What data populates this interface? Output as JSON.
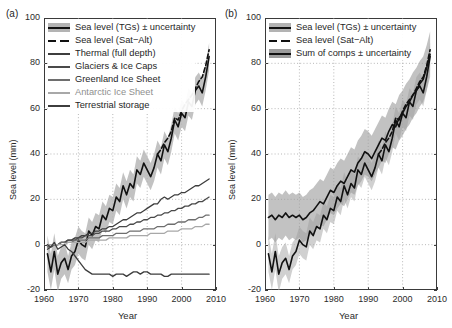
{
  "figure": {
    "panels": [
      {
        "tag": "(a)",
        "xlabel": "Year",
        "ylabel": "Sea level (mm)",
        "legend": [
          {
            "label": "Sea level (TGs) ± uncertainty",
            "style": "band-line",
            "color": "#111111",
            "band_color": "#b3b3b3"
          },
          {
            "label": "Sea level (Sat−Alt)",
            "style": "dashed",
            "color": "#111111"
          },
          {
            "label": "Thermal (full depth)",
            "style": "line",
            "color": "#3d3d3d"
          },
          {
            "label": "Glaciers & Ice Caps",
            "style": "line",
            "color": "#4a4a4a"
          },
          {
            "label": "Greenland Ice Sheet",
            "style": "line",
            "color": "#6e6e6e"
          },
          {
            "label": "Antarctic Ice Sheet",
            "style": "line",
            "color": "#a8a8a8"
          },
          {
            "label": "Terrestrial storage",
            "style": "line",
            "color": "#3d3d3d"
          }
        ]
      },
      {
        "tag": "(b)",
        "xlabel": "Year",
        "ylabel": "Sea level (mm)",
        "legend": [
          {
            "label": "Sea level (TGs) ± uncertainty",
            "style": "band-line",
            "color": "#111111",
            "band_color": "#b3b3b3"
          },
          {
            "label": "Sea level (Sat−Alt)",
            "style": "dashed",
            "color": "#111111"
          },
          {
            "label": "Sum of comps ± uncertainty",
            "style": "band-line",
            "color": "#111111",
            "band_color": "#9c9c9c"
          }
        ]
      }
    ]
  },
  "chart_data": [
    {
      "type": "line",
      "title": "",
      "panel": "(a)",
      "xlabel": "Year",
      "ylabel": "Sea level (mm)",
      "xlim": [
        1960,
        2010
      ],
      "ylim": [
        -20,
        100
      ],
      "xticks": [
        1960,
        1970,
        1980,
        1990,
        2000,
        2010
      ],
      "yticks": [
        -20,
        0,
        20,
        40,
        60,
        80,
        100
      ],
      "grid": true,
      "legend_position": "upper-left",
      "x": [
        1961,
        1962,
        1963,
        1964,
        1965,
        1966,
        1967,
        1968,
        1969,
        1970,
        1971,
        1972,
        1973,
        1974,
        1975,
        1976,
        1977,
        1978,
        1979,
        1980,
        1981,
        1982,
        1983,
        1984,
        1985,
        1986,
        1987,
        1988,
        1989,
        1990,
        1991,
        1992,
        1993,
        1994,
        1995,
        1996,
        1997,
        1998,
        1999,
        2000,
        2001,
        2002,
        2003,
        2004,
        2005,
        2006,
        2007,
        2008
      ],
      "series": [
        {
          "name": "Sea level (TGs) ± uncertainty",
          "style": "solid-with-band",
          "color": "#111111",
          "band_color": "#b3b3b3",
          "values": [
            -4,
            -12,
            -3,
            -13,
            -8,
            -6,
            -11,
            -5,
            -3,
            2,
            0,
            -1,
            6,
            4,
            8,
            7,
            13,
            11,
            16,
            15,
            21,
            19,
            26,
            22,
            27,
            25,
            33,
            31,
            36,
            33,
            30,
            34,
            40,
            37,
            44,
            41,
            47,
            55,
            52,
            58,
            56,
            63,
            61,
            68,
            70,
            67,
            74,
            83
          ],
          "band_lower": [
            -12,
            -20,
            -11,
            -21,
            -15,
            -13,
            -17,
            -11,
            -9,
            -4,
            -6,
            -7,
            0,
            -2,
            2,
            1,
            7,
            5,
            10,
            9,
            15,
            13,
            20,
            16,
            21,
            19,
            27,
            25,
            30,
            27,
            24,
            28,
            34,
            31,
            38,
            35,
            41,
            49,
            46,
            52,
            50,
            57,
            55,
            62,
            64,
            61,
            68,
            77
          ],
          "band_upper": [
            4,
            -4,
            5,
            -5,
            -1,
            1,
            -5,
            1,
            3,
            8,
            6,
            5,
            12,
            10,
            14,
            13,
            19,
            17,
            22,
            21,
            27,
            25,
            32,
            28,
            33,
            31,
            39,
            37,
            42,
            39,
            36,
            40,
            46,
            43,
            50,
            47,
            53,
            61,
            58,
            64,
            62,
            69,
            67,
            74,
            76,
            73,
            80,
            89
          ]
        },
        {
          "name": "Sea level (Sat−Alt)",
          "style": "dashed",
          "color": "#111111",
          "x": [
            1993,
            1994,
            1995,
            1996,
            1997,
            1998,
            1999,
            2000,
            2001,
            2002,
            2003,
            2004,
            2005,
            2006,
            2007,
            2008
          ],
          "values": [
            40,
            42,
            45,
            47,
            50,
            56,
            55,
            59,
            62,
            64,
            66,
            69,
            72,
            74,
            79,
            86
          ]
        },
        {
          "name": "Thermal (full depth)",
          "style": "solid",
          "color": "#3d3d3d",
          "values": [
            -2,
            -1,
            0,
            0,
            1,
            1,
            2,
            2,
            3,
            3,
            4,
            4,
            5,
            5,
            6,
            6,
            7,
            7,
            8,
            8,
            9,
            10,
            11,
            11,
            12,
            13,
            14,
            14,
            15,
            16,
            17,
            18,
            18,
            20,
            21,
            20,
            21,
            22,
            22,
            23,
            23,
            24,
            25,
            26,
            26,
            27,
            28,
            29
          ]
        },
        {
          "name": "Glaciers & Ice Caps",
          "style": "solid",
          "color": "#4a4a4a",
          "values": [
            -1,
            -1,
            0,
            0,
            1,
            1,
            2,
            2,
            2,
            3,
            3,
            4,
            4,
            4,
            5,
            5,
            6,
            6,
            6,
            7,
            7,
            8,
            8,
            8,
            9,
            9,
            10,
            10,
            11,
            11,
            12,
            12,
            13,
            13,
            14,
            14,
            15,
            15,
            16,
            16,
            17,
            17,
            18,
            18,
            19,
            19,
            20,
            21
          ]
        },
        {
          "name": "Greenland Ice Sheet",
          "style": "solid",
          "color": "#6e6e6e",
          "values": [
            0,
            0,
            0,
            0,
            1,
            1,
            1,
            1,
            2,
            2,
            2,
            2,
            3,
            3,
            3,
            3,
            4,
            4,
            4,
            4,
            5,
            5,
            5,
            5,
            6,
            6,
            6,
            6,
            7,
            7,
            7,
            7,
            8,
            8,
            8,
            9,
            9,
            9,
            10,
            10,
            10,
            11,
            11,
            11,
            12,
            12,
            13,
            13
          ]
        },
        {
          "name": "Antarctic Ice Sheet",
          "style": "solid",
          "color": "#a8a8a8",
          "values": [
            0,
            0,
            0,
            0,
            0,
            0,
            1,
            1,
            1,
            1,
            1,
            1,
            2,
            2,
            2,
            2,
            2,
            2,
            3,
            3,
            3,
            3,
            3,
            3,
            4,
            4,
            4,
            4,
            4,
            4,
            5,
            5,
            5,
            5,
            5,
            6,
            6,
            6,
            6,
            7,
            7,
            7,
            7,
            8,
            8,
            8,
            9,
            9
          ]
        },
        {
          "name": "Terrestrial storage",
          "style": "solid",
          "color": "#3d3d3d",
          "values": [
            0,
            -1,
            1,
            -2,
            -1,
            0,
            -2,
            -3,
            -5,
            -7,
            -9,
            -11,
            -12,
            -13,
            -13,
            -13,
            -13,
            -13,
            -13,
            -14,
            -13,
            -13,
            -13,
            -14,
            -13,
            -12,
            -12,
            -13,
            -12,
            -12,
            -13,
            -13,
            -13,
            -13,
            -14,
            -14,
            -13,
            -13,
            -13,
            -13,
            -13,
            -13,
            -13,
            -13,
            -13,
            -13,
            -13,
            -13
          ]
        }
      ]
    },
    {
      "type": "line",
      "title": "",
      "panel": "(b)",
      "xlabel": "Year",
      "ylabel": "Sea level (mm)",
      "xlim": [
        1960,
        2010
      ],
      "ylim": [
        -20,
        100
      ],
      "xticks": [
        1960,
        1970,
        1980,
        1990,
        2000,
        2010
      ],
      "yticks": [
        -20,
        0,
        20,
        40,
        60,
        80,
        100
      ],
      "grid": true,
      "legend_position": "upper-left",
      "x": [
        1961,
        1962,
        1963,
        1964,
        1965,
        1966,
        1967,
        1968,
        1969,
        1970,
        1971,
        1972,
        1973,
        1974,
        1975,
        1976,
        1977,
        1978,
        1979,
        1980,
        1981,
        1982,
        1983,
        1984,
        1985,
        1986,
        1987,
        1988,
        1989,
        1990,
        1991,
        1992,
        1993,
        1994,
        1995,
        1996,
        1997,
        1998,
        1999,
        2000,
        2001,
        2002,
        2003,
        2004,
        2005,
        2006,
        2007,
        2008
      ],
      "series": [
        {
          "name": "Sea level (TGs) ± uncertainty",
          "style": "solid-with-band",
          "color": "#111111",
          "band_color": "#b3b3b3",
          "values": [
            -4,
            -12,
            -3,
            -13,
            -8,
            -6,
            -11,
            -5,
            -3,
            2,
            0,
            -1,
            6,
            4,
            8,
            7,
            13,
            11,
            16,
            15,
            21,
            19,
            26,
            22,
            27,
            25,
            33,
            31,
            36,
            33,
            30,
            34,
            40,
            37,
            44,
            41,
            47,
            55,
            52,
            58,
            56,
            63,
            61,
            68,
            70,
            67,
            74,
            83
          ],
          "band_lower": [
            -12,
            -20,
            -11,
            -21,
            -15,
            -13,
            -17,
            -11,
            -9,
            -4,
            -6,
            -7,
            0,
            -2,
            2,
            1,
            7,
            5,
            10,
            9,
            15,
            13,
            20,
            16,
            21,
            19,
            27,
            25,
            30,
            27,
            24,
            28,
            34,
            31,
            38,
            35,
            41,
            49,
            46,
            52,
            50,
            57,
            55,
            62,
            64,
            61,
            68,
            77
          ],
          "band_upper": [
            4,
            -4,
            5,
            -5,
            -1,
            1,
            -5,
            1,
            3,
            8,
            6,
            5,
            12,
            10,
            14,
            13,
            19,
            17,
            22,
            21,
            27,
            25,
            32,
            28,
            33,
            31,
            39,
            37,
            42,
            39,
            36,
            40,
            46,
            43,
            50,
            47,
            53,
            61,
            58,
            64,
            62,
            69,
            67,
            74,
            76,
            73,
            80,
            89
          ]
        },
        {
          "name": "Sea level (Sat−Alt)",
          "style": "dashed",
          "color": "#111111",
          "x": [
            1993,
            1994,
            1995,
            1996,
            1997,
            1998,
            1999,
            2000,
            2001,
            2002,
            2003,
            2004,
            2005,
            2006,
            2007,
            2008
          ],
          "values": [
            40,
            42,
            45,
            47,
            50,
            56,
            55,
            59,
            62,
            64,
            66,
            69,
            72,
            74,
            79,
            86
          ]
        },
        {
          "name": "Sum of comps ± uncertainty",
          "style": "solid-with-band",
          "color": "#111111",
          "band_color": "#9c9c9c",
          "values": [
            12,
            13,
            11,
            13,
            12,
            14,
            12,
            13,
            12,
            13,
            11,
            12,
            14,
            15,
            17,
            19,
            18,
            21,
            24,
            23,
            26,
            28,
            27,
            30,
            33,
            32,
            36,
            38,
            41,
            40,
            38,
            41,
            44,
            47,
            46,
            50,
            53,
            52,
            56,
            58,
            61,
            63,
            66,
            68,
            71,
            73,
            78,
            84
          ],
          "band_lower": [
            2,
            3,
            1,
            3,
            2,
            4,
            2,
            3,
            2,
            3,
            1,
            2,
            4,
            5,
            7,
            9,
            8,
            11,
            14,
            13,
            16,
            18,
            17,
            20,
            23,
            22,
            26,
            28,
            31,
            30,
            28,
            31,
            34,
            37,
            36,
            40,
            43,
            42,
            46,
            48,
            51,
            53,
            56,
            58,
            61,
            63,
            68,
            74
          ],
          "band_upper": [
            22,
            23,
            21,
            23,
            22,
            24,
            22,
            23,
            22,
            23,
            21,
            22,
            24,
            25,
            27,
            29,
            28,
            31,
            34,
            33,
            36,
            38,
            37,
            40,
            43,
            42,
            46,
            48,
            51,
            50,
            48,
            51,
            54,
            57,
            56,
            60,
            63,
            62,
            66,
            68,
            71,
            73,
            76,
            78,
            81,
            83,
            88,
            94
          ]
        }
      ]
    }
  ]
}
